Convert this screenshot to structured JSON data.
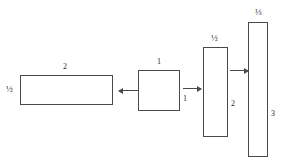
{
  "figure": {
    "title": ""
  },
  "shapes": [
    {
      "name": "rect-wide",
      "top_label": "2",
      "side_label": "½",
      "side_position": "left",
      "x": 20,
      "y": 75,
      "w": 93,
      "h": 30
    },
    {
      "name": "rect-square",
      "top_label": "1",
      "side_label": "1",
      "side_position": "right",
      "x": 138,
      "y": 70,
      "w": 42,
      "h": 41
    },
    {
      "name": "rect-tall",
      "top_label": "½",
      "side_label": "2",
      "side_position": "right",
      "x": 203,
      "y": 47,
      "w": 25,
      "h": 90
    },
    {
      "name": "rect-tallest",
      "top_label": "⅓",
      "side_label": "3",
      "side_position": "right",
      "x": 248,
      "y": 22,
      "w": 20,
      "h": 135
    }
  ],
  "arrows": [
    {
      "name": "arrow-square-to-wide",
      "direction": "left",
      "x": 119,
      "y": 90,
      "length": 20
    },
    {
      "name": "arrow-square-to-tall",
      "direction": "right",
      "x": 183,
      "y": 88,
      "length": 18
    },
    {
      "name": "arrow-tall-to-tallest",
      "direction": "right",
      "x": 230,
      "y": 70,
      "length": 18
    }
  ],
  "colors": {
    "stroke": "#4a4a4a",
    "text": "#2b2b2b",
    "background": "#ffffff"
  }
}
